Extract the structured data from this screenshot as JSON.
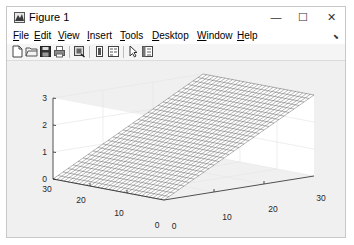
{
  "window": {
    "title": "Figure 1",
    "controls": {
      "minimize": "—",
      "maximize": "☐",
      "close": "✕"
    }
  },
  "menubar": {
    "items": [
      {
        "label_u": "F",
        "label_rest": "ile"
      },
      {
        "label_u": "E",
        "label_rest": "dit"
      },
      {
        "label_u": "V",
        "label_rest": "iew"
      },
      {
        "label_u": "I",
        "label_rest": "nsert"
      },
      {
        "label_u": "T",
        "label_rest": "ools"
      },
      {
        "label_u": "D",
        "label_rest": "esktop"
      },
      {
        "label_u": "W",
        "label_rest": "indow"
      },
      {
        "label_u": "H",
        "label_rest": "elp"
      }
    ],
    "dock_arrow": "⬊"
  },
  "toolbar": {
    "buttons": [
      "new-figure-icon",
      "open-file-icon",
      "save-icon",
      "print-icon",
      "link-plot-icon",
      "colorbar-icon",
      "legend-icon",
      "select-arrow-icon",
      "property-inspector-icon"
    ]
  },
  "chart_data": {
    "type": "surface-mesh",
    "title": "",
    "xlabel": "",
    "ylabel": "",
    "zlabel": "",
    "x_ticks": [
      "0",
      "10",
      "20",
      "30"
    ],
    "y_ticks": [
      "0",
      "10",
      "20",
      "30"
    ],
    "z_ticks": [
      "0",
      "1",
      "2",
      "3"
    ],
    "xlim": [
      0,
      30
    ],
    "ylim": [
      0,
      30
    ],
    "zlim": [
      0,
      3
    ],
    "grid": true,
    "mesh_resolution": 31,
    "surface": "z = x / 10 (plane rising from 0 at x=0 to 3 at x=30, constant along y)",
    "corner_values": [
      {
        "x": 0,
        "y": 0,
        "z": 0
      },
      {
        "x": 0,
        "y": 30,
        "z": 0
      },
      {
        "x": 30,
        "y": 0,
        "z": 3
      },
      {
        "x": 30,
        "y": 30,
        "z": 3
      }
    ],
    "colormap": "white faces, dark gray edges"
  }
}
